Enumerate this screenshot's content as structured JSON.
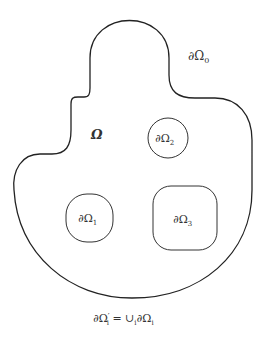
{
  "diagram": {
    "stroke_color": "#222222",
    "labels": {
      "outer_boundary": "∂Ω",
      "outer_boundary_sub": "0",
      "domain": "Ω",
      "hole1": "∂Ω",
      "hole1_sub": "1",
      "hole2": "∂Ω",
      "hole2_sub": "2",
      "hole3": "∂Ω",
      "hole3_sub": "3",
      "caption_left": "∂Ω",
      "caption_prime": "′",
      "caption_sub": "i",
      "caption_eq": " = ∪",
      "caption_union_sub": "i",
      "caption_right": "∂Ω",
      "caption_right_sub": "i"
    }
  }
}
